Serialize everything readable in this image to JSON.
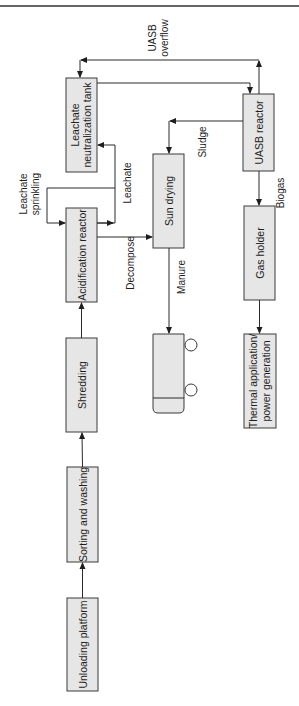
{
  "header": {
    "cut_off_text": ""
  },
  "colors": {
    "box_fill": "#e6e6e6",
    "box_stroke": "#3a3a3a",
    "line": "#2a2a2a",
    "text": "#1e1e1e"
  },
  "nodes": {
    "unloading": {
      "label": "Unloading platform"
    },
    "sorting": {
      "label": "Sorting and washing"
    },
    "shredding": {
      "label": "Shredding"
    },
    "acidification": {
      "label": "Acidification reactor"
    },
    "neutralization": {
      "line1": "Leachate",
      "line2": "neutralization tank"
    },
    "sun_drying": {
      "label": "Sun drying"
    },
    "uasb": {
      "label": "UASB reactor"
    },
    "gas_holder": {
      "label": "Gas holder"
    },
    "thermal": {
      "line1": "Thermal application/",
      "line2": "power generation"
    },
    "truck": {
      "label": ""
    }
  },
  "edges": {
    "uasb_overflow": {
      "line1": "UASB",
      "line2": "overflow"
    },
    "leachate_sprinkling": {
      "line1": "Leachate",
      "line2": "sprinkling"
    },
    "leachate": {
      "label": "Leachate"
    },
    "decompose": {
      "label": "Decompose"
    },
    "sludge": {
      "label": "Sludge"
    },
    "manure": {
      "label": "Manure"
    },
    "biogas": {
      "label": "Biogas"
    }
  }
}
